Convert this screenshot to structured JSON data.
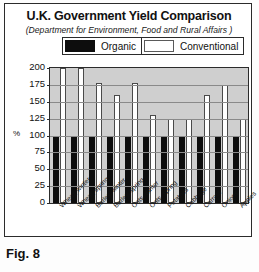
{
  "figure": {
    "caption": "Fig. 8"
  },
  "chart_data": {
    "type": "bar",
    "title": "U.K. Government Yield Comparison",
    "subtitle": "(Department for Environment, Food and Rural Affairs )",
    "xlabel": "",
    "ylabel": "%",
    "ylim": [
      0,
      200
    ],
    "yticks": [
      200,
      175,
      150,
      125,
      100,
      75,
      50,
      25,
      0
    ],
    "grid": true,
    "legend_position": "top",
    "categories": [
      "Wheat, winter",
      "Wheat, spring",
      "Barley, winter",
      "Barley, spring",
      "Oats, winter",
      "Oats, spring",
      "Potatoes",
      "Cabbage",
      "Carrots",
      "Onions",
      "Apples"
    ],
    "series": [
      {
        "name": "Organic",
        "color": "#0d0d0d",
        "values": [
          100,
          100,
          100,
          100,
          100,
          100,
          100,
          100,
          100,
          100,
          100
        ]
      },
      {
        "name": "Conventional",
        "color": "#ffffff",
        "values": [
          200,
          200,
          178,
          160,
          178,
          130,
          125,
          125,
          160,
          175,
          125
        ]
      }
    ]
  }
}
